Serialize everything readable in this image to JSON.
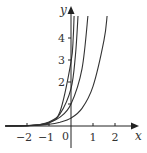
{
  "chart_data": {
    "type": "line",
    "title": "",
    "xlabel": "x",
    "ylabel": "y",
    "xlim": [
      -3,
      3
    ],
    "ylim": [
      -0.8,
      5.2
    ],
    "grid": false,
    "legend": null,
    "x_ticks": [
      -2,
      -1,
      1,
      2
    ],
    "x_tick_labels": [
      "−2",
      "−1",
      "1",
      "2"
    ],
    "y_ticks": [
      1,
      2,
      3,
      4
    ],
    "y_tick_labels": [
      "",
      "2",
      "3",
      "4"
    ],
    "origin_label": "0",
    "series": [
      {
        "name": "curve-1",
        "x": [
          -3,
          -2,
          -1.5,
          -1,
          -0.5,
          0,
          0.1,
          0.14
        ],
        "y": [
          0.0,
          0.01,
          0.04,
          0.15,
          0.65,
          2.9,
          4.0,
          5.0
        ]
      },
      {
        "name": "curve-2",
        "x": [
          -3,
          -2,
          -1.5,
          -1,
          -0.5,
          0,
          0.2,
          0.32
        ],
        "y": [
          0.0,
          0.02,
          0.06,
          0.18,
          0.55,
          1.7,
          3.2,
          5.0
        ]
      },
      {
        "name": "curve-3",
        "x": [
          -3,
          -2,
          -1.5,
          -1,
          -0.5,
          0,
          0.5,
          0.77
        ],
        "y": [
          0.0,
          0.02,
          0.05,
          0.15,
          0.4,
          1.0,
          2.6,
          5.0
        ]
      },
      {
        "name": "curve-4",
        "x": [
          -3,
          -2,
          -1,
          -0.5,
          0,
          0.5,
          1,
          1.5,
          1.64
        ],
        "y": [
          0.0,
          0.02,
          0.08,
          0.17,
          0.36,
          0.8,
          1.8,
          3.9,
          5.0
        ]
      }
    ]
  }
}
